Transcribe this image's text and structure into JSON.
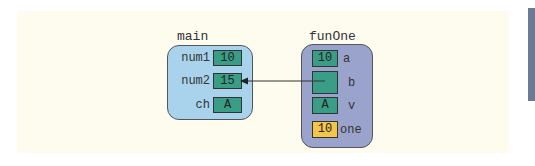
{
  "colors": {
    "panel_bg": "#fdfcef",
    "main_frame_bg": "#a9d3ec",
    "fun_frame_bg": "#9aa3cc",
    "cell_green": "#3a9d86",
    "cell_yellow": "#f3c64a",
    "side_bar": "#6c7a93"
  },
  "main": {
    "title": "main",
    "vars": [
      {
        "name": "num1",
        "value": "10"
      },
      {
        "name": "num2",
        "value": "15"
      },
      {
        "name": "ch",
        "value": "A"
      }
    ]
  },
  "funOne": {
    "title": "funOne",
    "vars": [
      {
        "name": "a",
        "value": "10",
        "kind": "value"
      },
      {
        "name": "b",
        "value": "",
        "kind": "reference",
        "points_to": "main.num2"
      },
      {
        "name": "v",
        "value": "A",
        "kind": "value"
      },
      {
        "name": "one",
        "value": "10",
        "kind": "local"
      }
    ]
  }
}
